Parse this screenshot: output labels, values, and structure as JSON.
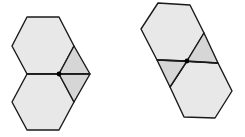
{
  "figures": [
    {
      "name": "figure-left",
      "description": "Two hexagons stacked vertically sharing an edge, with a rhombus on the right split by the shared line; a dot at the shared vertex",
      "hexagons": [
        "27,17 59,17 74,46 59,74 27,74 12,46",
        "27,74 59,74 74,102 59,130 27,130 12,102"
      ],
      "rhombi": [
        "74,46 90,74 59,74",
        "59,74 90,74 74,102"
      ],
      "lines": [
        [
          27,
          74,
          90,
          74
        ]
      ],
      "dot": [
        59,
        74
      ]
    },
    {
      "name": "figure-right",
      "description": "Two hexagons arranged diagonally sharing a vertex region, with two shaded triangles between them split by a line; a dot at the center",
      "hexagons": [
        "158,3 190,5 204,33 187,61 157,60 141,29",
        "187,61 218,63 232,91 215,118 184,117 170,87"
      ],
      "rhombi": [
        "204,33 218,63 187,61",
        "157,60 187,61 170,87"
      ],
      "lines": [
        [
          157,
          60,
          218,
          63
        ]
      ],
      "dot": [
        187,
        61
      ]
    }
  ],
  "colors": {
    "hex_fill": "#e8e8e8",
    "rhombus_fill": "#d6d6d6",
    "stroke": "#1a1a1a",
    "dot": "#000000",
    "background": "#ffffff"
  }
}
